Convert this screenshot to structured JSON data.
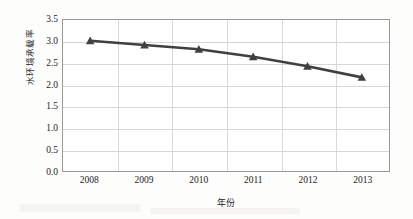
{
  "chart_data": {
    "type": "line",
    "title": "",
    "subtitle": "",
    "xlabel": "年份",
    "ylabel": "水环境承载率",
    "categories": [
      "2008",
      "2009",
      "2010",
      "2011",
      "2012",
      "2013"
    ],
    "x": [
      2008,
      2009,
      2010,
      2011,
      2012,
      2013
    ],
    "values": [
      3.02,
      2.92,
      2.82,
      2.65,
      2.43,
      2.17
    ],
    "series": [
      {
        "name": "水环境承载率",
        "values": [
          3.02,
          2.92,
          2.82,
          2.65,
          2.43,
          2.17
        ],
        "color": "#404040",
        "marker": "triangle",
        "line_width": 2.6
      }
    ],
    "ylim": [
      0.0,
      3.5
    ],
    "y_ticks": [
      "0.0",
      "0.5",
      "1.0",
      "1.5",
      "2.0",
      "2.5",
      "3.0",
      "3.5"
    ],
    "y_tick_values": [
      0.0,
      0.5,
      1.0,
      1.5,
      2.0,
      2.5,
      3.0,
      3.5
    ],
    "x_ticks": [
      "2008",
      "2009",
      "2010",
      "2011",
      "2012",
      "2013"
    ],
    "grid": {
      "horizontal": true,
      "vertical": true,
      "color": "#d6d6d6"
    },
    "legend": {
      "visible": false,
      "position": "none",
      "entries": []
    },
    "plot_border_color": "#9a9a9a",
    "background_color": "#ffffff"
  }
}
